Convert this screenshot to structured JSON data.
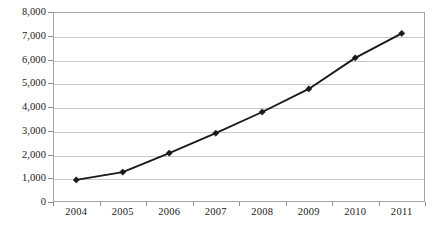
{
  "chart_data": {
    "type": "line",
    "title": "",
    "subtitle": "",
    "xlabel": "",
    "ylabel": "",
    "categories": [
      "2004",
      "2005",
      "2006",
      "2007",
      "2008",
      "2009",
      "2010",
      "2011"
    ],
    "series": [
      {
        "name": "series-1",
        "values": [
          930,
          1260,
          2060,
          2900,
          3790,
          4760,
          6070,
          7100
        ],
        "color": "#1a1a1a",
        "marker": "diamond"
      }
    ],
    "ylim": [
      0,
      8000
    ],
    "y_ticks": [
      0,
      1000,
      2000,
      3000,
      4000,
      5000,
      6000,
      7000,
      8000
    ],
    "y_tick_labels": [
      "0",
      "1,000",
      "2,000",
      "3,000",
      "4,000",
      "5,000",
      "6,000",
      "7,000",
      "8,000"
    ],
    "x_tick_labels": [
      "2004",
      "2005",
      "2006",
      "2007",
      "2008",
      "2009",
      "2010",
      "2011"
    ],
    "grid": true,
    "grid_axis": "y",
    "legend": false,
    "legend_position": "none",
    "annotations": [],
    "colors": {
      "line": "#1a1a1a",
      "marker": "#1a1a1a",
      "gridline": "#c8c8c8",
      "axis": "#a6a6a6",
      "plot_background": "#ffffff",
      "text": "#1a1a1a"
    }
  }
}
